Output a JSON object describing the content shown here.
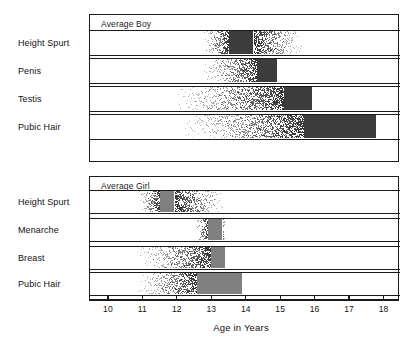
{
  "chart_data": {
    "type": "bar",
    "title": "",
    "xlabel": "Age in Years",
    "ylabel": "",
    "xlim": [
      9.45,
      18.45
    ],
    "xticks": [
      10,
      11,
      12,
      13,
      14,
      15,
      16,
      17,
      18
    ],
    "xticklabels": [
      "10",
      "11",
      "12",
      "13",
      "14",
      "15",
      "16",
      "17",
      "18"
    ],
    "grid": false,
    "legend": "none",
    "panels": [
      {
        "name": "boy-panel",
        "title": "Average Boy",
        "categories": [
          "Height Spurt",
          "Penis",
          "Testis",
          "Pubic Hair"
        ],
        "events": [
          {
            "label": "Height Spurt",
            "start": 12.7,
            "peak_start": 13.5,
            "peak_end": 14.2,
            "end": 15.7,
            "style": "stipple-fade-both"
          },
          {
            "label": "Penis",
            "start": 12.6,
            "peak_start": 14.3,
            "peak_end": 14.9,
            "end": 14.9,
            "style": "stipple-fade-left-solid-right"
          },
          {
            "label": "Testis",
            "start": 11.7,
            "peak_start": 15.1,
            "peak_end": 15.9,
            "end": 15.9,
            "style": "stipple-fade-left-solid-right"
          },
          {
            "label": "Pubic Hair",
            "start": 11.9,
            "peak_start": 15.7,
            "peak_end": 17.8,
            "end": 17.8,
            "style": "stipple-fade-left-solid-right"
          }
        ]
      },
      {
        "name": "girl-panel",
        "title": "Average Girl",
        "categories": [
          "Height Spurt",
          "Menarche",
          "Breast",
          "Pubic Hair"
        ],
        "events": [
          {
            "label": "Height Spurt",
            "start": 10.8,
            "peak_start": 11.5,
            "peak_end": 11.9,
            "end": 13.4,
            "style": "stipple-fade-both"
          },
          {
            "label": "Menarche",
            "start": 12.5,
            "peak_start": 12.9,
            "peak_end": 13.3,
            "end": 13.4,
            "style": "stipple-fade-both"
          },
          {
            "label": "Breast",
            "start": 10.7,
            "peak_start": 13.0,
            "peak_end": 13.4,
            "end": 13.4,
            "style": "stipple-fade-left-solid-right"
          },
          {
            "label": "Pubic Hair",
            "start": 10.7,
            "peak_start": 12.6,
            "peak_end": 13.9,
            "end": 13.9,
            "style": "stipple-fade-left-solid-right"
          }
        ]
      }
    ],
    "colors": {
      "ink": "#1a1a1a",
      "background": "#ffffff",
      "boy_solid": "#3c3c3c",
      "girl_solid": "#808080",
      "stipple": "#2e2e2e"
    }
  }
}
